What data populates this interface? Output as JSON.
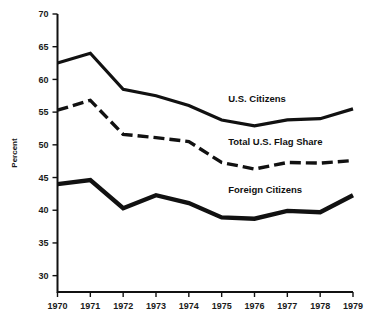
{
  "chart_data": {
    "type": "line",
    "title": "",
    "xlabel": "",
    "ylabel": "Percent",
    "x": [
      1970,
      1971,
      1972,
      1973,
      1974,
      1975,
      1976,
      1977,
      1978,
      1979
    ],
    "xticklabels": [
      "1970",
      "1971",
      "1972",
      "1973",
      "1974",
      "1975",
      "1976",
      "1977",
      "1978",
      "1979"
    ],
    "yticks": [
      30,
      35,
      40,
      45,
      50,
      55,
      60,
      65,
      70
    ],
    "yticklabels": [
      "30",
      "35",
      "40",
      "45",
      "50",
      "55",
      "60",
      "65",
      "70"
    ],
    "ylim": [
      27.5,
      70
    ],
    "xlim": [
      1970,
      1979
    ],
    "grid": false,
    "legend": "inline-annotations",
    "series": [
      {
        "name": "U.S. Citizens",
        "style": "solid",
        "color": "#111111",
        "values": [
          62.5,
          64.0,
          58.5,
          57.5,
          56.0,
          53.8,
          52.9,
          53.8,
          54.0,
          55.5
        ],
        "label_x": 1975.2,
        "label_y": 56.6
      },
      {
        "name": "Total U.S. Flag Share",
        "style": "dashed",
        "color": "#111111",
        "values": [
          55.3,
          56.8,
          51.6,
          51.1,
          50.5,
          47.3,
          46.3,
          47.3,
          47.2,
          47.6
        ],
        "label_x": 1975.2,
        "label_y": 50.0
      },
      {
        "name": "Foreign Citizens",
        "style": "solid-thick",
        "color": "#111111",
        "values": [
          44.0,
          44.6,
          40.3,
          42.3,
          41.1,
          38.9,
          38.7,
          39.9,
          39.7,
          42.3
        ],
        "label_x": 1975.2,
        "label_y": 42.7
      }
    ]
  }
}
